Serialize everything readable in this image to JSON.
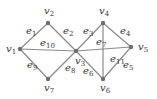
{
  "diagram": {
    "type": "graph",
    "colors": {
      "edge": "#8a8a8a",
      "node": "#6e6e6e",
      "label": "#3a3a3a",
      "background": "#ffffff"
    },
    "nodes": [
      {
        "id": "v1",
        "label": "v",
        "sub": "1",
        "x": 20,
        "y": 49,
        "lx": 6,
        "ly": 52
      },
      {
        "id": "v2",
        "label": "v",
        "sub": "2",
        "x": 48,
        "y": 23,
        "lx": 44,
        "ly": 14
      },
      {
        "id": "v3",
        "label": "v",
        "sub": "3",
        "x": 76,
        "y": 51,
        "lx": 75,
        "ly": 64
      },
      {
        "id": "v4",
        "label": "v",
        "sub": "4",
        "x": 103,
        "y": 23,
        "lx": 99,
        "ly": 14
      },
      {
        "id": "v5",
        "label": "v",
        "sub": "5",
        "x": 131,
        "y": 47,
        "lx": 138,
        "ly": 50
      },
      {
        "id": "v6",
        "label": "v",
        "sub": "6",
        "x": 103,
        "y": 79,
        "lx": 100,
        "ly": 91
      },
      {
        "id": "v7",
        "label": "v",
        "sub": "7",
        "x": 48,
        "y": 79,
        "lx": 44,
        "ly": 91
      }
    ],
    "edges": [
      {
        "id": "e1",
        "label": "e",
        "sub": "1",
        "from": "v1",
        "to": "v2",
        "lx": 26,
        "ly": 34
      },
      {
        "id": "e2",
        "label": "e",
        "sub": "2",
        "from": "v2",
        "to": "v3",
        "lx": 63,
        "ly": 34
      },
      {
        "id": "e3",
        "label": "e",
        "sub": "3",
        "from": "v3",
        "to": "v4",
        "lx": 83,
        "ly": 34
      },
      {
        "id": "e4",
        "label": "e",
        "sub": "4",
        "from": "v4",
        "to": "v5",
        "lx": 120,
        "ly": 34
      },
      {
        "id": "e5",
        "label": "e",
        "sub": "5",
        "from": "v5",
        "to": "v6",
        "lx": 123,
        "ly": 68
      },
      {
        "id": "e6",
        "label": "e",
        "sub": "6",
        "from": "v6",
        "to": "v3",
        "lx": 83,
        "ly": 74
      },
      {
        "id": "e7",
        "label": "e",
        "sub": "7",
        "from": "v4",
        "to": "v6",
        "lx": 96,
        "ly": 45
      },
      {
        "id": "e8",
        "label": "e",
        "sub": "8",
        "from": "v3",
        "to": "v7",
        "lx": 65,
        "ly": 71
      },
      {
        "id": "e9",
        "label": "e",
        "sub": "9",
        "from": "v7",
        "to": "v1",
        "lx": 27,
        "ly": 68
      },
      {
        "id": "e10",
        "label": "e",
        "sub": "10",
        "from": "v1",
        "to": "v3",
        "lx": 40,
        "ly": 46
      },
      {
        "id": "e11",
        "label": "e",
        "sub": "11",
        "from": "v3",
        "to": "v5",
        "lx": 110,
        "ly": 62
      }
    ]
  }
}
